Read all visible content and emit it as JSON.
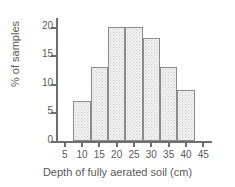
{
  "chart_data": {
    "type": "bar",
    "title": "",
    "subtitle": "",
    "xlabel": "Depth of fully aerated soil (cm)",
    "ylabel": "% of samples",
    "categories": [
      "7.5-12.5",
      "12.5-17.5",
      "17.5-22.5",
      "22.5-27.5",
      "27.5-32.5",
      "32.5-37.5",
      "37.5-42.5"
    ],
    "bin_edges": [
      7.5,
      12.5,
      17.5,
      22.5,
      27.5,
      32.5,
      37.5,
      42.5
    ],
    "values": [
      7,
      13,
      20,
      20,
      18,
      13,
      9
    ],
    "xlim": [
      2.5,
      47.5
    ],
    "ylim": [
      0,
      21.5
    ],
    "xticks": [
      5,
      10,
      15,
      20,
      25,
      30,
      35,
      40,
      45
    ],
    "yticks": [
      0,
      5,
      10,
      15,
      20
    ],
    "xtick_labels": [
      "5",
      "10",
      "15",
      "20",
      "25",
      "30",
      "35",
      "40",
      "45"
    ],
    "ytick_labels": [
      "0",
      "5",
      "10",
      "15",
      "20"
    ],
    "grid": false,
    "legend": null,
    "legend_position": "none",
    "colors": {
      "bar_fill": "#f4f4f4",
      "bar_pattern": "#c9c9c9",
      "bar_border": "#8c8c8c",
      "axis": "#6e6e6e",
      "text": "#5a5a5a",
      "background": "#ffffff"
    }
  }
}
